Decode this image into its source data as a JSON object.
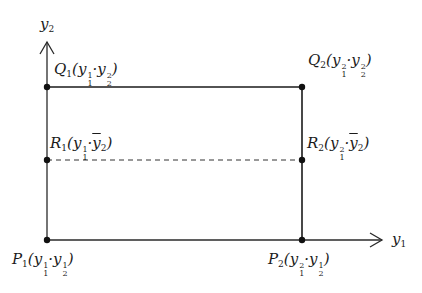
{
  "diagram": {
    "axes": {
      "x_label": "y₁",
      "y_label": "y₂"
    },
    "points": [
      {
        "id": "P1",
        "name": "P",
        "sub": "1",
        "coord1_base": "y",
        "coord1_sub": "1",
        "coord1_sup": "1",
        "coord2_base": "y",
        "coord2_sub": "2",
        "coord2_sup": "1",
        "label": "P₁(y₁¹·y₂¹)",
        "x": 47,
        "y": 240
      },
      {
        "id": "P2",
        "name": "P",
        "sub": "2",
        "coord1_base": "y",
        "coord1_sub": "1",
        "coord1_sup": "2",
        "coord2_base": "y",
        "coord2_sub": "2",
        "coord2_sup": "1",
        "label": "P₂(y₁²·y₂¹)",
        "x": 302,
        "y": 240
      },
      {
        "id": "Q1",
        "name": "Q",
        "sub": "1",
        "coord1_base": "y",
        "coord1_sub": "1",
        "coord1_sup": "1",
        "coord2_base": "y",
        "coord2_sub": "2",
        "coord2_sup": "2",
        "label": "Q₁(y₁¹·y₂²)",
        "x": 47,
        "y": 87
      },
      {
        "id": "Q2",
        "name": "Q",
        "sub": "2",
        "coord1_base": "y",
        "coord1_sub": "1",
        "coord1_sup": "2",
        "coord2_base": "y",
        "coord2_sub": "2",
        "coord2_sup": "2",
        "label": "Q₂(y₁²·y₂²)",
        "x": 302,
        "y": 87
      },
      {
        "id": "R1",
        "name": "R",
        "sub": "1",
        "coord1_base": "y",
        "coord1_sub": "1",
        "coord1_sup": "1",
        "coord2_base": "ȳ",
        "coord2_sub": "2",
        "coord2_sup": "",
        "label": "R₁(y₁¹·ȳ₂)",
        "x": 47,
        "y": 160
      },
      {
        "id": "R2",
        "name": "R",
        "sub": "2",
        "coord1_base": "y",
        "coord1_sub": "1",
        "coord1_sup": "2",
        "coord2_base": "ȳ",
        "coord2_sub": "2",
        "coord2_sup": "",
        "label": "R₂(y₁²·ȳ₂)",
        "x": 302,
        "y": 160
      }
    ],
    "caption": ""
  },
  "colors": {
    "line": "#1a1a1a",
    "background": "#ffffff"
  }
}
